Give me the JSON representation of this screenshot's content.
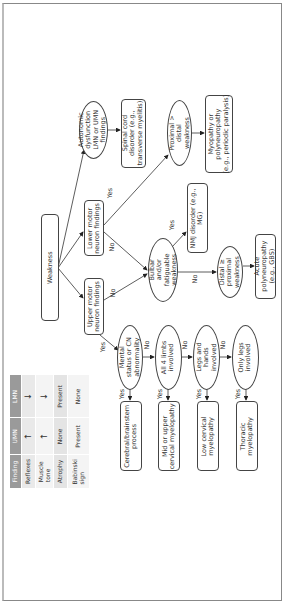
{
  "diagram": {
    "title": "Weakness",
    "nodes": {
      "weakness": "Weakness",
      "umn_findings": "Upper motor\nneuron findings",
      "lmn_findings": "Lower motor\nneuron findings",
      "autonomic": "Autonomic\ndysfunction\nLMN or UMN\nfindings",
      "spinal_cord": "Spinal cord\ndisorder (e.g.,\ntransverse myelitis)",
      "proximal": "Proximal >\ndistal\nweakness",
      "myopathy": "Myopathy or\npolyneuropathy\n(e.g., periodic paralysis)",
      "bulbar": "Bulbar\nand/or\nfatiguable\nweakness",
      "nmj": "NMJ disorder (e.g.,\nMG)",
      "distal": "Distal ≥\nproximal\nweakness",
      "acute_poly": "Acute\npolyneuropathy\n(e.g., GBS)",
      "mental_status": "Mental\nstatus or CN\nabnormality",
      "all4": "All 4 limbs\ninvolved",
      "legs_hands": "Legs and\nhands\ninvolved",
      "only_legs": "Only legs\ninvolved",
      "cerebral": "Cerebral/brainstem\nprocess",
      "mid_upper": "Mid or upper\ncervical myelopathy",
      "low_cervical": "Low cervical\nmyelopathy",
      "thoracic": "Thoracic\nmyelopathy"
    },
    "edge_labels": {
      "yes": "Yes",
      "no": "No"
    }
  },
  "table": {
    "headers": [
      "Finding",
      "UMN",
      "LMN"
    ],
    "rows": [
      {
        "finding": "Reflexes",
        "umn": "↑",
        "lmn": "↓"
      },
      {
        "finding": "Muscle\ntone",
        "umn": "↑",
        "lmn": "↓"
      },
      {
        "finding": "Atrophy",
        "umn": "None",
        "lmn": "Present"
      },
      {
        "finding": "Babinski\nsign",
        "umn": "Present",
        "lmn": "None"
      }
    ],
    "colors": {
      "header": "#9a9a9a",
      "row_a": "#e9e9e9",
      "row_b": "#f4f4f4"
    }
  }
}
